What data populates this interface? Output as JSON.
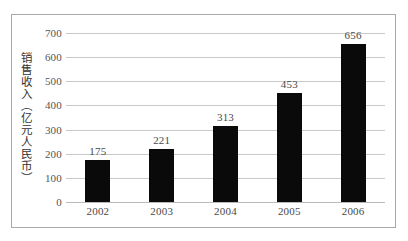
{
  "chart_data": {
    "type": "bar",
    "title": "",
    "xlabel": "",
    "ylabel": "销售收入（亿元人民币）",
    "categories": [
      "2002",
      "2003",
      "2004",
      "2005",
      "2006"
    ],
    "values": [
      175,
      221,
      313,
      453,
      656
    ],
    "value_labels": [
      "175",
      "221",
      "313",
      "453",
      "656"
    ],
    "ylim": [
      0,
      700
    ],
    "ytick_values": [
      0,
      100,
      200,
      300,
      400,
      500,
      600,
      700
    ],
    "ytick_labels": [
      "0",
      "100",
      "200",
      "300",
      "400",
      "500",
      "600",
      "700"
    ],
    "grid": true,
    "legend": false,
    "legend_position": "none",
    "series": [
      {
        "name": "销售收入",
        "values": [
          175,
          221,
          313,
          453,
          656
        ],
        "color": "#0a0a0a"
      }
    ]
  },
  "style": {
    "bar_color": "#0a0a0a",
    "gridline_color": "#c9c9c9",
    "border_color": "#a8a8a8",
    "label_color": "#4a4a4a",
    "background": "#ffffff"
  }
}
